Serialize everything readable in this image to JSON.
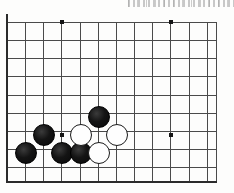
{
  "diagram": {
    "kind": "go-board-diagram",
    "board": {
      "origin_x": 7,
      "origin_y": 22,
      "spacing": 18.15,
      "columns": 12,
      "rows": 9,
      "line_color": "#4a4a4a",
      "edge_color": "#2b2b2b",
      "background_color": "#fdfdfc"
    },
    "star_points": [
      {
        "name": "star-point-top-left",
        "x": 62,
        "y": 22
      },
      {
        "name": "star-point-top-right",
        "x": 171,
        "y": 22
      },
      {
        "name": "star-point-center-left",
        "x": 62,
        "y": 135
      },
      {
        "name": "star-point-center-right",
        "x": 171,
        "y": 135
      }
    ],
    "stones": [
      {
        "name": "black-stone-1",
        "color": "black",
        "x": 99,
        "y": 117
      },
      {
        "name": "black-stone-2",
        "color": "black",
        "x": 44,
        "y": 135
      },
      {
        "name": "black-stone-3",
        "color": "black",
        "x": 26,
        "y": 153
      },
      {
        "name": "black-stone-4",
        "color": "black",
        "x": 62,
        "y": 153
      },
      {
        "name": "black-stone-5",
        "color": "black",
        "x": 81,
        "y": 153
      },
      {
        "name": "white-stone-1",
        "color": "white",
        "x": 81,
        "y": 135
      },
      {
        "name": "white-stone-2",
        "color": "white",
        "x": 117,
        "y": 135
      },
      {
        "name": "white-stone-3",
        "color": "white",
        "x": 99,
        "y": 153
      }
    ],
    "stone_colors": {
      "black_fill": "#141414",
      "white_fill": "#fefefe",
      "white_outline": "#1a1a1a"
    },
    "artifacts": [
      {
        "name": "scan-noise-strip",
        "x": 128,
        "y": 0,
        "width": 106,
        "height": 7
      }
    ]
  }
}
